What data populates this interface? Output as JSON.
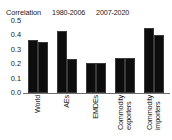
{
  "chart_data": {
    "type": "bar",
    "title": "Correlation",
    "xlabel": "",
    "ylabel": "",
    "categories": [
      "World",
      "AEs",
      "EMDEs",
      "Commodity exporters",
      "Commodity importers"
    ],
    "series": [
      {
        "name": "1980-2006",
        "color": "#0d0d0d",
        "values": [
          0.37,
          0.43,
          0.205,
          0.245,
          0.45
        ]
      },
      {
        "name": "2007-2020",
        "color": "#0d0d0d",
        "values": [
          0.355,
          0.235,
          0.205,
          0.245,
          0.4
        ]
      }
    ],
    "ylim": [
      0.0,
      0.5
    ],
    "ytick_labels": [
      "0.5",
      "0.4",
      "0.3",
      "0.2",
      "0.1",
      "0.0"
    ],
    "ytick_values": [
      0.5,
      0.4,
      0.3,
      0.2,
      0.1,
      0.0
    ],
    "grid": false,
    "legend_position": "top-left"
  },
  "legend": {
    "title": "Correlation",
    "entries": [
      {
        "label": "1980-2006",
        "marker": "square-marker"
      },
      {
        "label": "2007-2020",
        "marker": "square-marker"
      }
    ]
  },
  "axis": {
    "y_ticks": [
      "0.5",
      "0.4",
      "0.3",
      "0.2",
      "0.1",
      "0.0"
    ]
  },
  "categories": [
    {
      "line1": "World",
      "line2": ""
    },
    {
      "line1": "AEs",
      "line2": ""
    },
    {
      "line1": "EMDEs",
      "line2": ""
    },
    {
      "line1": "Commodity",
      "line2": "exporters"
    },
    {
      "line1": "Commodity",
      "line2": "importers"
    }
  ]
}
